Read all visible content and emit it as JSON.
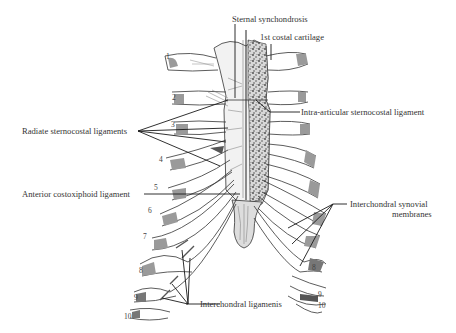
{
  "figure": {
    "labels": {
      "sternal_synchondrosis": "Sternal synchondrosis",
      "first_costal_cartilage": "1st costal cartilage",
      "intra_articular": "Intra-articular sternocostal ligament",
      "radiate": "Radiate sternocostal ligaments",
      "anterior_costoxiphoid": "Anterior costoxiphoid ligament",
      "interchondral_synovial_line1": "Interchondral synovial",
      "interchondral_synovial_line2": "membranes",
      "interchondral_ligaments": "Interchondral ligamenis"
    },
    "rib_numbers_left": [
      "1",
      "2",
      "3",
      "4",
      "5",
      "6",
      "7",
      "8",
      "9",
      "10"
    ],
    "rib_numbers_right": [
      "8",
      "9",
      "10"
    ],
    "colors": {
      "ink": "#2a2a2a",
      "bone_shade": "#8a8a8a",
      "cartilage_fill": "#efefef",
      "background": "#ffffff"
    }
  }
}
